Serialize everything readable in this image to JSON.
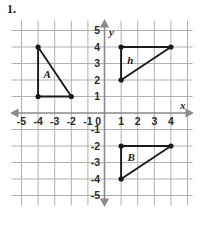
{
  "problem": {
    "number": "1."
  },
  "graph": {
    "axis_labels": {
      "x": "x",
      "y": "y"
    },
    "x_ticks": [
      {
        "value": -5,
        "label": "-5"
      },
      {
        "value": -4,
        "label": "-4"
      },
      {
        "value": -3,
        "label": "-3"
      },
      {
        "value": -2,
        "label": "-2"
      },
      {
        "value": -1,
        "label": "-1"
      },
      {
        "value": 0,
        "label": "0"
      },
      {
        "value": 1,
        "label": "1"
      },
      {
        "value": 2,
        "label": "2"
      },
      {
        "value": 3,
        "label": "3"
      },
      {
        "value": 4,
        "label": "4"
      }
    ],
    "y_ticks": [
      {
        "value": 5,
        "label": "5"
      },
      {
        "value": 4,
        "label": "4"
      },
      {
        "value": 3,
        "label": "3"
      },
      {
        "value": 2,
        "label": "2"
      },
      {
        "value": 1,
        "label": "1"
      },
      {
        "value": 0,
        "label": "0"
      },
      {
        "value": -1,
        "label": "-1"
      },
      {
        "value": -2,
        "label": "-2"
      },
      {
        "value": -3,
        "label": "-3"
      },
      {
        "value": -4,
        "label": "-4"
      },
      {
        "value": -5,
        "label": "-5"
      }
    ],
    "xlim": [
      -5.6,
      5.3
    ],
    "ylim": [
      -5.6,
      5.6
    ],
    "grid": true,
    "grid_color": "#b0b0b0",
    "axis_color": "#8a8a8a",
    "shape_color": "#1a1a1a",
    "shapes": [
      {
        "label": "A",
        "label_point": [
          -3.45,
          2.15
        ],
        "vertices": [
          [
            -4,
            4
          ],
          [
            -4,
            1
          ],
          [
            -2,
            1
          ]
        ],
        "closed": true
      },
      {
        "label": "h",
        "label_point": [
          1.55,
          3.0
        ],
        "vertices": [
          [
            1,
            4
          ],
          [
            4,
            4
          ],
          [
            1,
            2
          ]
        ],
        "closed": true
      },
      {
        "label": "B",
        "label_point": [
          1.6,
          -2.9
        ],
        "vertices": [
          [
            1,
            -2
          ],
          [
            4,
            -2
          ],
          [
            1,
            -4
          ]
        ],
        "closed": true
      }
    ]
  }
}
